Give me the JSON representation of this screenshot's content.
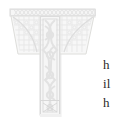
{
  "page": {
    "background_color": "#ffffff",
    "width": 118,
    "height": 124
  },
  "dropcap": {
    "letter": "T",
    "style": "illuminated-celtic-knotwork",
    "description": "Faded decorative illuminated capital letter T with interlaced knotwork fill and geometric border ornament",
    "ink_color": "#e3e3e3",
    "outline_color": "#d2d2d2",
    "fill_color": "#f4f4f4",
    "shadow_color": "#ececec",
    "knot_color": "#e9e9e9"
  },
  "body_text": {
    "text_color": "#2a2a2a",
    "lines": [
      {
        "text": "h"
      },
      {
        "text": "il"
      },
      {
        "text": "h"
      }
    ]
  }
}
